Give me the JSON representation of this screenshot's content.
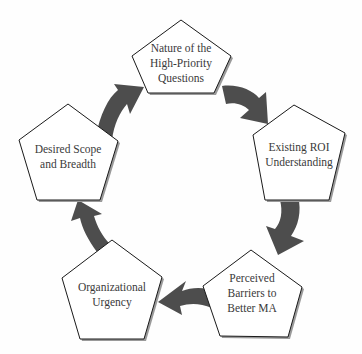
{
  "diagram": {
    "type": "cycle",
    "colors": {
      "pentagon_fill": "#ffffff",
      "pentagon_stroke": "#1a1a1a",
      "pentagon_shadow": "#9a9a9a",
      "arrow_fill": "#4d4d4d",
      "text": "#3a3a3a"
    },
    "nodes": [
      {
        "id": "nature",
        "lines": [
          "Nature of the",
          "High-Priority",
          "Questions"
        ]
      },
      {
        "id": "roi",
        "lines": [
          "Existing ROI",
          "Understanding"
        ]
      },
      {
        "id": "barriers",
        "lines": [
          "Perceived",
          "Barriers to",
          "Better MA"
        ]
      },
      {
        "id": "urgency",
        "lines": [
          "Organizational",
          "Urgency"
        ]
      },
      {
        "id": "scope",
        "lines": [
          "Desired Scope",
          "and Breadth"
        ]
      }
    ],
    "edges": [
      {
        "from": "nature",
        "to": "roi",
        "icon": "curved-arrow-icon"
      },
      {
        "from": "roi",
        "to": "barriers",
        "icon": "curved-arrow-icon"
      },
      {
        "from": "barriers",
        "to": "urgency",
        "icon": "curved-arrow-icon"
      },
      {
        "from": "urgency",
        "to": "scope",
        "icon": "curved-arrow-icon"
      },
      {
        "from": "scope",
        "to": "nature",
        "icon": "curved-arrow-icon"
      }
    ]
  }
}
